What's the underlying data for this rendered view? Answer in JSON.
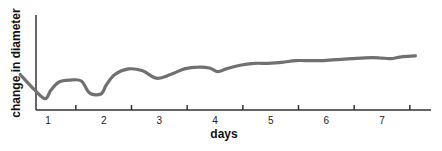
{
  "chart_data": {
    "type": "line",
    "title": "",
    "xlabel": "days",
    "ylabel": "change in diameter",
    "x_tick_labels": [
      "1",
      "2",
      "3",
      "4",
      "5",
      "6",
      "7"
    ],
    "y_tick_labels": [],
    "grid": false,
    "legend": null,
    "xlim": [
      0.5,
      7.6
    ],
    "series": [
      {
        "name": "change in diameter",
        "color": "#707070",
        "x": [
          0.5,
          0.75,
          0.95,
          1.05,
          1.2,
          1.4,
          1.6,
          1.75,
          1.95,
          2.05,
          2.2,
          2.45,
          2.7,
          2.95,
          3.2,
          3.45,
          3.7,
          3.9,
          4.05,
          4.2,
          4.45,
          4.7,
          4.95,
          5.2,
          5.45,
          5.7,
          5.95,
          6.2,
          6.45,
          6.7,
          6.95,
          7.15,
          7.35,
          7.6
        ],
        "values": [
          0.36,
          0.2,
          0.1,
          0.19,
          0.28,
          0.3,
          0.29,
          0.16,
          0.15,
          0.25,
          0.36,
          0.42,
          0.4,
          0.32,
          0.36,
          0.42,
          0.44,
          0.43,
          0.39,
          0.42,
          0.46,
          0.48,
          0.48,
          0.49,
          0.51,
          0.51,
          0.51,
          0.52,
          0.53,
          0.54,
          0.54,
          0.53,
          0.55,
          0.56
        ]
      }
    ]
  },
  "axes": {
    "x_title": "days",
    "y_title": "change in diameter"
  }
}
